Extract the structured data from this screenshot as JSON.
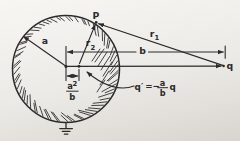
{
  "figure": {
    "type": "physics-image-charge-diagram",
    "labels": {
      "point_P": "P",
      "radius": "a",
      "r1": {
        "base": "r",
        "sub": "1"
      },
      "r2": {
        "base": "r",
        "sub": "2"
      },
      "distance_b": "b",
      "charge_q": "q",
      "image_distance": {
        "num_base": "a",
        "num_sup": "2",
        "den": "b"
      },
      "equation": {
        "lhs": "q′",
        "equals": "=",
        "minus": "−",
        "num": "a",
        "den": "b",
        "rhs": "q"
      }
    },
    "colors": {
      "ink": "#2b2b2b",
      "paper_light": "#f7f6f3",
      "paper_dark": "#d8d5d0"
    }
  }
}
